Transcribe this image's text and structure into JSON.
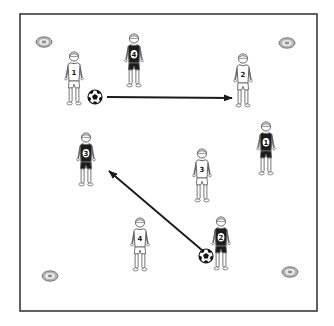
{
  "diagram": {
    "kind": "soccer-passing-drill",
    "canvas": {
      "width": 334,
      "height": 326
    },
    "field": {
      "x": 20,
      "y": 14,
      "width": 297,
      "height": 297,
      "border_color": "#3a3a3a",
      "background": "#ffffff"
    },
    "teams": {
      "white": {
        "name": "white-team",
        "jersey_color": "#ffffff",
        "number_color": "#1a1a1a"
      },
      "dark": {
        "name": "dark-team",
        "jersey_color": "#1c1c1c",
        "number_color": "#1a1a1a",
        "number_patch_color": "#ffffff"
      }
    },
    "players": [
      {
        "team": "white",
        "number": "1",
        "x": 74,
        "y": 79
      },
      {
        "team": "dark",
        "number": "4",
        "x": 134,
        "y": 61
      },
      {
        "team": "white",
        "number": "2",
        "x": 243,
        "y": 81
      },
      {
        "team": "dark",
        "number": "1",
        "x": 266,
        "y": 149
      },
      {
        "team": "dark",
        "number": "3",
        "x": 86,
        "y": 160
      },
      {
        "team": "white",
        "number": "3",
        "x": 202,
        "y": 176
      },
      {
        "team": "white",
        "number": "4",
        "x": 140,
        "y": 245
      },
      {
        "team": "dark",
        "number": "2",
        "x": 221,
        "y": 244
      }
    ],
    "balls": [
      {
        "x": 95,
        "y": 97
      },
      {
        "x": 206,
        "y": 256
      }
    ],
    "arrows": [
      {
        "x1": 107,
        "y1": 97,
        "x2": 232,
        "y2": 98,
        "color": "#1a1a1a"
      },
      {
        "x1": 203,
        "y1": 251,
        "x2": 109,
        "y2": 171,
        "color": "#1a1a1a"
      }
    ],
    "cones": [
      {
        "x": 44,
        "y": 42
      },
      {
        "x": 287,
        "y": 43
      },
      {
        "x": 50,
        "y": 276
      },
      {
        "x": 290,
        "y": 272
      }
    ],
    "cone_colors": {
      "outer": "#b3b3b3",
      "ring": "#ececec",
      "center": "#8f8f8f",
      "outline": "#6f6f6f"
    },
    "figure_outline_color": "#666666"
  }
}
